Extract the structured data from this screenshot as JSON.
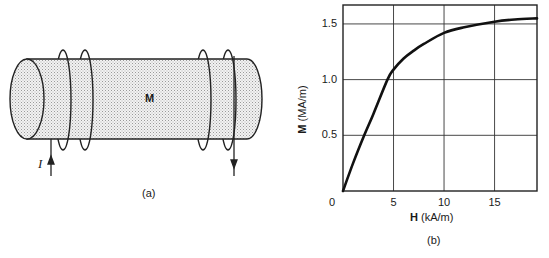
{
  "panel_a": {
    "caption": "(a)",
    "magnetization_label": "M",
    "current_label": "I",
    "description": "Cylindrical magnetic material with two pairs of wire coils carrying current I"
  },
  "panel_b": {
    "caption": "(b)"
  },
  "chart_data": {
    "type": "line",
    "title": "",
    "xlabel": "H (kA/m)",
    "ylabel": "M (MA/m)",
    "xlabel_bold_symbol": "H",
    "xlabel_unit": "(kA/m)",
    "ylabel_bold_symbol": "M",
    "ylabel_unit": "(MA/m)",
    "xlim": [
      0,
      19.2
    ],
    "ylim": [
      0,
      1.67
    ],
    "x_ticks": [
      "0",
      "5",
      "10",
      "15"
    ],
    "y_ticks": [
      "0.5",
      "1.0",
      "1.5"
    ],
    "grid": true,
    "legend": null,
    "series": [
      {
        "name": "Magnetization curve",
        "x": [
          0,
          1,
          2.1,
          3,
          4.4,
          5,
          6,
          7,
          8,
          10,
          12,
          15,
          17,
          19.2
        ],
        "y": [
          0,
          0.25,
          0.5,
          0.69,
          1.0,
          1.09,
          1.19,
          1.26,
          1.32,
          1.42,
          1.47,
          1.52,
          1.54,
          1.55
        ]
      }
    ]
  }
}
